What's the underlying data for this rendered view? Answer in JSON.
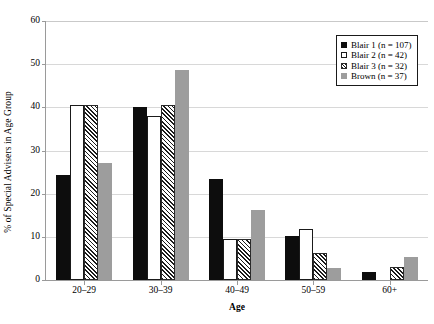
{
  "chart_data": {
    "type": "bar",
    "title": "",
    "xlabel": "Age",
    "ylabel": "% of Special Advisers in Age Group",
    "categories": [
      "20–29",
      "30–39",
      "40–49",
      "50–59",
      "60+"
    ],
    "ylim": [
      0,
      60
    ],
    "yticks": [
      0,
      10,
      20,
      30,
      40,
      50,
      60
    ],
    "ytick_labels": [
      "0",
      "10",
      "20",
      "30",
      "40",
      "50",
      "60"
    ],
    "grid": true,
    "legend_position": "top-right",
    "series": [
      {
        "name": "Blair 1 (n = 107)",
        "style": "solid-black",
        "color": "#0d0d0d",
        "values": [
          24.3,
          40.0,
          23.4,
          10.3,
          1.9
        ]
      },
      {
        "name": "Blair 2 (n = 42)",
        "style": "white-outline",
        "color": "#ffffff",
        "values": [
          40.5,
          38.0,
          9.5,
          11.9,
          0.0
        ]
      },
      {
        "name": "Blair 3 (n = 32)",
        "style": "diagonal-hatch",
        "color": "#1b1b1b",
        "values": [
          40.6,
          40.6,
          9.4,
          6.3,
          3.1
        ]
      },
      {
        "name": "Brown (n = 37)",
        "style": "solid-gray",
        "color": "#9d9d9d",
        "values": [
          27.0,
          48.6,
          16.2,
          2.7,
          5.4
        ]
      }
    ]
  },
  "legend": {
    "items": [
      {
        "label": "Blair 1 (n = 107)"
      },
      {
        "label": "Blair 2 (n = 42)"
      },
      {
        "label": "Blair 3 (n = 32)"
      },
      {
        "label": "Brown (n = 37)"
      }
    ]
  }
}
